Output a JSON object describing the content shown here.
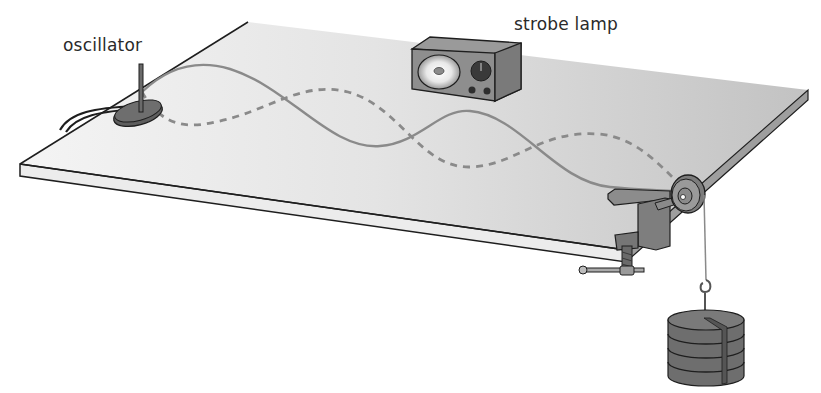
{
  "labels": {
    "oscillator": "oscillator",
    "strobe_lamp": "strobe lamp"
  },
  "components": [
    {
      "name": "oscillator",
      "description": "vibration generator with rod, connected by cable, at left end of string"
    },
    {
      "name": "strobe lamp",
      "description": "box lamp with round reflector, dial and two knobs"
    },
    {
      "name": "string",
      "description": "standing wave: solid and dashed curves showing two extreme positions"
    },
    {
      "name": "pulley",
      "description": "pulley wheel clamped to table edge"
    },
    {
      "name": "clamp",
      "description": "G-clamp with screw handle holding pulley"
    },
    {
      "name": "slotted masses",
      "description": "stack of four slotted masses on hook hanger"
    }
  ],
  "colors": {
    "table_top": "#d4d4d4",
    "table_top_light": "#f2f2f2",
    "table_edge": "#e8e8e8",
    "outline": "#1e1e1e",
    "string": "#8a8a8a",
    "device_dark": "#6e6e6e",
    "device_mid": "#8c8c8c",
    "label_text": "#2a2a2a"
  },
  "wave": {
    "loops": 4,
    "nodes": 5
  }
}
